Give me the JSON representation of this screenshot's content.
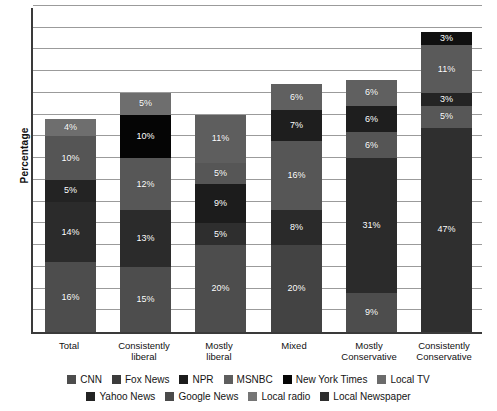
{
  "chart_data": {
    "type": "bar",
    "subtype": "stacked-bar",
    "title": "",
    "xlabel": "",
    "ylabel": "Percentage",
    "ylim": [
      0,
      75
    ],
    "grid": true,
    "gridline_interval": 5,
    "legend_position": "bottom",
    "categories": [
      "Total",
      "Consistently liberal",
      "Mostly liberal",
      "Mixed",
      "Mostly Conservative",
      "Consistently Conservative"
    ],
    "category_lines": [
      [
        "Total"
      ],
      [
        "Consistently",
        "liberal"
      ],
      [
        "Mostly",
        "liberal"
      ],
      [
        "Mixed"
      ],
      [
        "Mostly",
        "Conservative"
      ],
      [
        "Consistently",
        "Conservative"
      ]
    ],
    "series": [
      {
        "name": "CNN",
        "color": "#4d4d4d",
        "values": [
          16,
          15,
          20,
          20,
          9,
          0
        ]
      },
      {
        "name": "Fox News",
        "color": "#2b2b2b",
        "values": [
          14,
          13,
          0,
          0,
          31,
          47
        ]
      },
      {
        "name": "NPR",
        "color": "#1c1c1c",
        "values": [
          0,
          0,
          9,
          0,
          0,
          0
        ]
      },
      {
        "name": "MSNBC",
        "color": "#5e5e5e",
        "values": [
          0,
          0,
          0,
          0,
          0,
          0
        ]
      },
      {
        "name": "New York Times",
        "color": "#050505",
        "values": [
          0,
          10,
          0,
          0,
          0,
          0
        ]
      },
      {
        "name": "Local TV",
        "color": "#6b6b6b",
        "values": [
          0,
          0,
          0,
          0,
          0,
          0
        ]
      },
      {
        "name": "Yahoo News",
        "color": "#232323",
        "values": [
          5,
          0,
          0,
          7,
          6,
          3
        ]
      },
      {
        "name": "Google News",
        "color": "#3a3a3a",
        "values": [
          10,
          12,
          5,
          16,
          0,
          0
        ]
      },
      {
        "name": "Local radio",
        "color": "#757575",
        "values": [
          4,
          5,
          11,
          6,
          6,
          11
        ]
      },
      {
        "name": "Local Newspaper",
        "color": "#2e2e2e",
        "values": [
          0,
          0,
          5,
          8,
          6,
          5
        ]
      }
    ],
    "bars": [
      {
        "category": "Total",
        "total": 49,
        "segments": [
          {
            "series": "CNN",
            "value": 16,
            "label": "16%",
            "color": "#4d4d4d"
          },
          {
            "series": "Fox News",
            "value": 14,
            "label": "14%",
            "color": "#2b2b2b"
          },
          {
            "series": "Yahoo News",
            "value": 5,
            "label": "5%",
            "color": "#232323"
          },
          {
            "series": "Google News",
            "value": 10,
            "label": "10%",
            "color": "#555555"
          },
          {
            "series": "Local radio",
            "value": 4,
            "label": "4%",
            "color": "#6e6e6e"
          }
        ]
      },
      {
        "category": "Consistently liberal",
        "total": 55,
        "segments": [
          {
            "series": "CNN",
            "value": 15,
            "label": "15%",
            "color": "#4d4d4d"
          },
          {
            "series": "Fox News",
            "value": 13,
            "label": "13%",
            "color": "#2b2b2b"
          },
          {
            "series": "Google News",
            "value": 12,
            "label": "12%",
            "color": "#575757"
          },
          {
            "series": "New York Times",
            "value": 10,
            "label": "10%",
            "color": "#050505"
          },
          {
            "series": "Local radio",
            "value": 5,
            "label": "5%",
            "color": "#6e6e6e"
          }
        ]
      },
      {
        "category": "Mostly liberal",
        "total": 50,
        "segments": [
          {
            "series": "CNN",
            "value": 20,
            "label": "20%",
            "color": "#4d4d4d"
          },
          {
            "series": "Local Newspaper",
            "value": 5,
            "label": "5%",
            "color": "#2e2e2e"
          },
          {
            "series": "NPR",
            "value": 9,
            "label": "9%",
            "color": "#1c1c1c"
          },
          {
            "series": "Google News",
            "value": 5,
            "label": "5%",
            "color": "#565656"
          },
          {
            "series": "Local radio",
            "value": 11,
            "label": "11%",
            "color": "#5e5e5e"
          }
        ]
      },
      {
        "category": "Mixed",
        "total": 57,
        "segments": [
          {
            "series": "CNN",
            "value": 20,
            "label": "20%",
            "color": "#434343"
          },
          {
            "series": "Local Newspaper",
            "value": 8,
            "label": "8%",
            "color": "#2a2a2a"
          },
          {
            "series": "Google News",
            "value": 16,
            "label": "16%",
            "color": "#565656"
          },
          {
            "series": "Yahoo News",
            "value": 7,
            "label": "7%",
            "color": "#1e1e1e"
          },
          {
            "series": "Local radio",
            "value": 6,
            "label": "6%",
            "color": "#606060"
          }
        ]
      },
      {
        "category": "Mostly Conservative",
        "total": 58,
        "segments": [
          {
            "series": "CNN",
            "value": 9,
            "label": "9%",
            "color": "#4d4d4d"
          },
          {
            "series": "Fox News",
            "value": 31,
            "label": "31%",
            "color": "#2b2b2b"
          },
          {
            "series": "Local Newspaper",
            "value": 6,
            "label": "6%",
            "color": "#555555"
          },
          {
            "series": "Yahoo News",
            "value": 6,
            "label": "6%",
            "color": "#1e1e1e"
          },
          {
            "series": "Local radio",
            "value": 6,
            "label": "6%",
            "color": "#606060"
          }
        ]
      },
      {
        "category": "Consistently Conservative",
        "total": 69,
        "segments": [
          {
            "series": "Fox News",
            "value": 47,
            "label": "47%",
            "color": "#2f2f2f"
          },
          {
            "series": "Local Newspaper",
            "value": 5,
            "label": "5%",
            "color": "#575757"
          },
          {
            "series": "Yahoo News",
            "value": 3,
            "label": "3%",
            "color": "#242424"
          },
          {
            "series": "Local radio",
            "value": 11,
            "label": "11%",
            "color": "#5a5a5a"
          },
          {
            "series": "New York Times",
            "value": 3,
            "label": "3%",
            "color": "#101010"
          }
        ]
      }
    ],
    "legend": [
      {
        "label": "CNN",
        "color": "#4d4d4d"
      },
      {
        "label": "Fox News",
        "color": "#3b3b3b"
      },
      {
        "label": "NPR",
        "color": "#1c1c1c"
      },
      {
        "label": "MSNBC",
        "color": "#5e5e5e"
      },
      {
        "label": "New York Times",
        "color": "#050505"
      },
      {
        "label": "Local TV",
        "color": "#6b6b6b"
      },
      {
        "label": "Yahoo News",
        "color": "#232323"
      },
      {
        "label": "Google News",
        "color": "#4a4a4a"
      },
      {
        "label": "Local radio",
        "color": "#757575"
      },
      {
        "label": "Local Newspaper",
        "color": "#2e2e2e"
      }
    ],
    "legend_rows": [
      [
        "CNN",
        "Fox News",
        "NPR",
        "MSNBC",
        "New York Times",
        "Local TV"
      ],
      [
        "Yahoo News",
        "Google News",
        "Local radio",
        "Local Newspaper"
      ]
    ]
  },
  "axis": {
    "y_title": "Percentage"
  }
}
